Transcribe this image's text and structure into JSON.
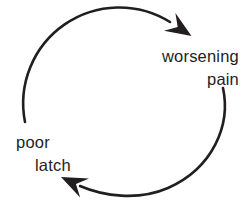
{
  "diagram": {
    "type": "cycle",
    "title": "",
    "colors": {
      "ink": "#221e1f",
      "background": "#ffffff"
    },
    "nodes": [
      {
        "id": "worsening-pain",
        "label": "worsening pain",
        "line1": "worsening",
        "line2": "pain",
        "position": "top-right"
      },
      {
        "id": "poor-latch",
        "label": "poor latch",
        "line1": "poor",
        "line2": "latch",
        "position": "left"
      }
    ],
    "edges": [
      {
        "from": "poor latch",
        "to": "worsening pain",
        "shape": "curved arrow, clockwise over the top, arrowhead pointing down-right"
      },
      {
        "from": "worsening pain",
        "to": "poor latch",
        "shape": "curved arrow, clockwise around the bottom, arrowhead pointing up-left"
      }
    ]
  }
}
